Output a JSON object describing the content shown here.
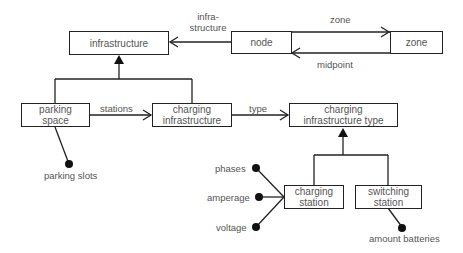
{
  "diagram": {
    "type": "entity-relationship / object model",
    "nodes": {
      "infrastructure": "infrastructure",
      "node": "node",
      "zone": "zone",
      "parking_space": "parking\nspace",
      "charging_infrastructure": "charging\ninfrastructure",
      "charging_infrastructure_type": "charging\ninfrastructure type",
      "charging_station": "charging\nstation",
      "switching_station": "switching\nstation"
    },
    "edges": {
      "node_to_infrastructure": "infra-\nstructure",
      "node_to_zone": "zone",
      "zone_to_node": "midpoint",
      "parking_to_charging": "stations",
      "charging_to_type": "type"
    },
    "attributes": {
      "parking_slots": "parking slots",
      "phases": "phases",
      "amperage": "amperage",
      "voltage": "voltage",
      "amount_batteries": "amount batteries"
    }
  }
}
